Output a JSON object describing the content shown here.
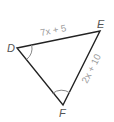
{
  "diagram": {
    "type": "triangle",
    "vertices": [
      {
        "name": "D",
        "x": 17,
        "y": 48,
        "label_x": 7,
        "label_y": 52
      },
      {
        "name": "E",
        "x": 100,
        "y": 31,
        "label_x": 97,
        "label_y": 28
      },
      {
        "name": "F",
        "x": 63,
        "y": 105,
        "label_x": 59,
        "label_y": 117
      }
    ],
    "sides": [
      {
        "from": "D",
        "to": "E",
        "label": "7x + 5"
      },
      {
        "from": "E",
        "to": "F",
        "label": "2x + 10"
      },
      {
        "from": "D",
        "to": "F",
        "label": ""
      }
    ],
    "angle_marks": [
      {
        "vertex": "D",
        "arcs": 1
      },
      {
        "vertex": "F",
        "arcs": 1
      }
    ],
    "colors": {
      "stroke": "#222222",
      "vertex_label": "#555555",
      "side_label": "#9a9a9a",
      "arc": "#888888"
    }
  }
}
